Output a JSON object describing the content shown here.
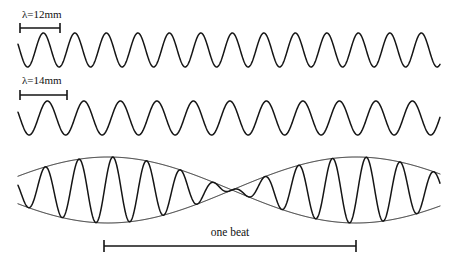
{
  "figure": {
    "title_alt": "Two waves of slightly different wavelength superposing to produce beats",
    "background_color": "#ffffff",
    "stroke_color": "#151515"
  },
  "measures": [
    {
      "id": "wavelength-1",
      "label": "λ=12mm",
      "label_x": 22,
      "label_y": 18,
      "bar_x1": 20,
      "bar_x2": 60,
      "bar_y": 28,
      "cap_half_height": 5
    },
    {
      "id": "wavelength-2",
      "label": "λ=14mm",
      "label_x": 22,
      "label_y": 84,
      "bar_x1": 20,
      "bar_x2": 67,
      "bar_y": 95,
      "cap_half_height": 5
    },
    {
      "id": "one-beat",
      "label": "one beat",
      "label_x": 230,
      "label_y": 236,
      "bar_x1": 104,
      "bar_x2": 356,
      "bar_y": 246,
      "cap_half_height": 6
    }
  ],
  "chart_data": {
    "type": "line",
    "title": "",
    "xlabel": "",
    "ylabel": "",
    "grid": false,
    "legend": null,
    "annotations": [
      {
        "text": "λ=12mm",
        "refers_to": "wave-1",
        "value": 12,
        "unit": "mm"
      },
      {
        "text": "λ=14mm",
        "refers_to": "wave-2",
        "value": 14,
        "unit": "mm"
      },
      {
        "text": "one beat",
        "refers_to": "beat-wave",
        "span_start_x": 104,
        "span_end_x": 356
      }
    ],
    "series": [
      {
        "name": "wave-1",
        "description": "sinusoid, wavelength 12 mm",
        "wavelength_mm": 12,
        "wavelength_px": 31.5,
        "amplitude_px": 17,
        "baseline_y": 50,
        "x_start": 18,
        "x_end": 440,
        "phase_deg": 160
      },
      {
        "name": "wave-2",
        "description": "sinusoid, wavelength 14 mm",
        "wavelength_mm": 14,
        "wavelength_px": 36.5,
        "amplitude_px": 17,
        "baseline_y": 118,
        "x_start": 18,
        "x_end": 440,
        "phase_deg": 160
      },
      {
        "name": "beat-wave",
        "description": "superposition of wave-1 and wave-2 showing beats",
        "baseline_y": 190,
        "carrier_wavelength_px": 33.8,
        "envelope_wavelength_px": 252,
        "amplitude_px": 33,
        "x_start": 18,
        "x_end": 440,
        "node_x_positions": [
          108,
          356
        ],
        "antinode_x_positions": [
          232
        ],
        "phase_deg": 160
      }
    ],
    "envelopes": [
      {
        "name": "upper-envelope",
        "points_description": "absolute cosine envelope above baseline y=190, nodes at x=108 and x=356"
      },
      {
        "name": "lower-envelope",
        "points_description": "absolute cosine envelope below baseline y=190, nodes at x=108 and x=356"
      }
    ]
  }
}
